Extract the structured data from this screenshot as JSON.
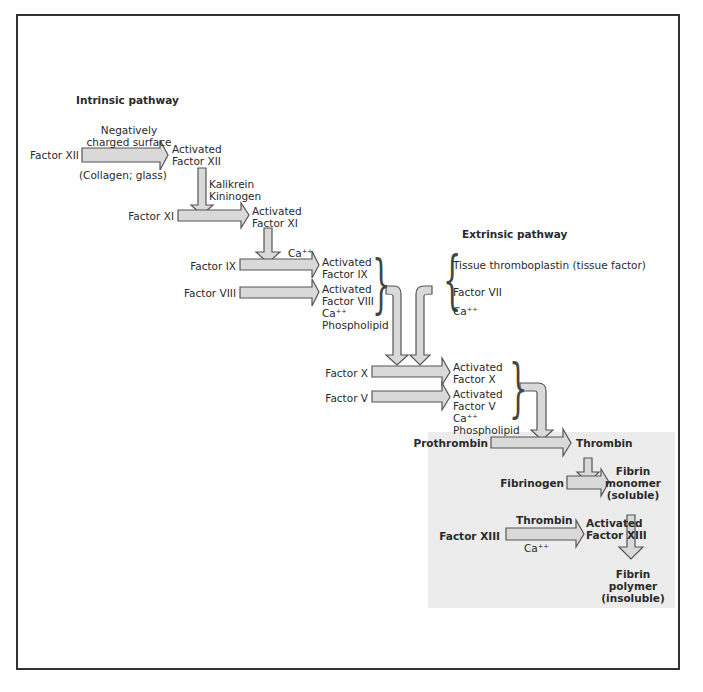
{
  "diagram": {
    "intrinsic_title": "Intrinsic pathway",
    "extrinsic_title": "Extrinsic pathway",
    "intrinsic": {
      "factor_xii": "Factor XII",
      "surface_line1": "Negatively",
      "surface_line2": "charged surface",
      "collagen": "(Collagen; glass)",
      "act_xii_1": "Activated",
      "act_xii_2": "Factor XII",
      "kalikrein": "Kalikrein",
      "kininogen": "Kininogen",
      "factor_xi": "Factor XI",
      "act_xi_1": "Activated",
      "act_xi_2": "Factor XI",
      "ca1": "Ca⁺⁺",
      "factor_ix": "Factor IX",
      "act_ix_1": "Activated",
      "act_ix_2": "Factor IX",
      "factor_viii": "Factor VIII",
      "act_viii_1": "Activated",
      "act_viii_2": "Factor VIII",
      "act_viii_3": "Ca⁺⁺",
      "act_viii_4": "Phospholipid"
    },
    "extrinsic": {
      "tissue": "Tissue thromboplastin (tissue factor)",
      "factor_vii": "Factor VII",
      "ca": "Ca⁺⁺"
    },
    "common": {
      "factor_x": "Factor X",
      "act_x_1": "Activated",
      "act_x_2": "Factor X",
      "factor_v": "Factor V",
      "act_v_1": "Activated",
      "act_v_2": "Factor V",
      "act_v_3": "Ca⁺⁺",
      "act_v_4": "Phospholipid",
      "prothrombin": "Prothrombin",
      "thrombin": "Thrombin",
      "fibrinogen": "Fibrinogen",
      "fibrin_mono_1": "Fibrin",
      "fibrin_mono_2": "monomer",
      "fibrin_mono_3": "(soluble)",
      "factor_xiii": "Factor XIII",
      "thrombin2": "Thrombin",
      "ca2": "Ca⁺⁺",
      "act_xiii_1": "Activated",
      "act_xiii_2": "Factor XIII",
      "fibrin_poly_1": "Fibrin",
      "fibrin_poly_2": "polymer",
      "fibrin_poly_3": "(insoluble)"
    },
    "colors": {
      "arrow_fill": "#d9d9d9",
      "arrow_stroke": "#555555",
      "shade": "#ececec"
    }
  }
}
